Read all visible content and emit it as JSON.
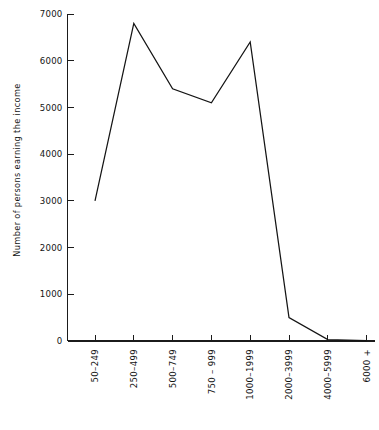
{
  "chart_data": {
    "type": "line",
    "title": "",
    "subtitle": "",
    "xlabel": "",
    "ylabel": "Number of persons earning the income",
    "categories": [
      "50–249",
      "250–499",
      "500–749",
      "750 – 999",
      "1000–1999",
      "2000–3999",
      "4000–5999",
      "6000 +"
    ],
    "values": [
      3000,
      6800,
      5400,
      5100,
      6400,
      500,
      30,
      10
    ],
    "series": [
      {
        "name": "Number of persons earning the income",
        "values": [
          3000,
          6800,
          5400,
          5100,
          6400,
          500,
          30,
          10
        ]
      }
    ],
    "ylim": [
      0,
      7000
    ],
    "ytick_labels": [
      "0",
      "1000",
      "2000",
      "3000",
      "4000",
      "5000",
      "6000",
      "7000"
    ],
    "ytick_values": [
      0,
      1000,
      2000,
      3000,
      4000,
      5000,
      6000,
      7000
    ],
    "grid": false,
    "legend": "none",
    "line_color": "#141414",
    "axis_color": "#1b1b1b",
    "background_color": "#ffffff",
    "xtick_label_rotation": 90
  }
}
